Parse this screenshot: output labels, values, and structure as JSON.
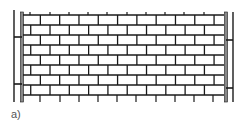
{
  "figure": {
    "label": "a)",
    "colors": {
      "line": "#1a1a1a",
      "column_fill": "#888888",
      "background": "#ffffff",
      "label": "#555555"
    }
  },
  "wall": {
    "x_left": 23,
    "x_right": 224,
    "y_top": 15,
    "y_bottom": 95,
    "rows": 8,
    "brick_length": 19.3,
    "top_ticks_x": [
      30,
      50,
      69,
      88,
      107,
      127,
      146,
      165,
      184,
      204
    ],
    "bottom_ticks_x": [
      40,
      60,
      79,
      98,
      117,
      136,
      156,
      175,
      194,
      213
    ]
  },
  "columns": {
    "left": {
      "outer_x": 14,
      "inner_x": 22,
      "ties_y": [
        37,
        84
      ]
    },
    "right": {
      "inner_x": 226,
      "outer_x": 233,
      "ties_y": [
        40,
        88
      ]
    },
    "y_top": 12,
    "y_bottom": 102
  }
}
